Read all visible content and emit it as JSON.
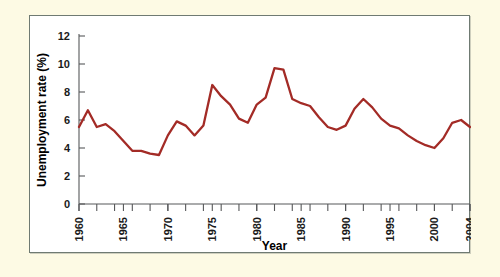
{
  "figure": {
    "background_color": "#fdfae4",
    "panel_background_color": "#ffffff",
    "panel_border_color": "#6f7a72",
    "line_color": "#a32b26",
    "axis_color": "#57585a"
  },
  "chart_data": {
    "type": "line",
    "title": "",
    "xlabel": "Year",
    "ylabel": "Unemployment rate (%)",
    "xlim": [
      1960,
      2004
    ],
    "ylim": [
      0,
      12
    ],
    "grid": false,
    "legend": "none",
    "y_ticks": [
      0,
      2,
      4,
      6,
      8,
      10,
      12
    ],
    "y_tick_labels": [
      "0",
      "2",
      "4",
      "6",
      "8",
      "10",
      "12"
    ],
    "x_ticks": [
      1960,
      1965,
      1970,
      1975,
      1980,
      1985,
      1990,
      1995,
      2000,
      2004
    ],
    "x_tick_labels": [
      "1960",
      "1965",
      "1970",
      "1975",
      "1980",
      "1985",
      "1990",
      "1995",
      "2000",
      "2004"
    ],
    "x_minor_tick_interval": 1,
    "x": [
      1960,
      1961,
      1962,
      1963,
      1964,
      1965,
      1966,
      1967,
      1968,
      1969,
      1970,
      1971,
      1972,
      1973,
      1974,
      1975,
      1976,
      1977,
      1978,
      1979,
      1980,
      1981,
      1982,
      1983,
      1984,
      1985,
      1986,
      1987,
      1988,
      1989,
      1990,
      1991,
      1992,
      1993,
      1994,
      1995,
      1996,
      1997,
      1998,
      1999,
      2000,
      2001,
      2002,
      2003,
      2004
    ],
    "values": [
      5.5,
      6.7,
      5.5,
      5.7,
      5.2,
      4.5,
      3.8,
      3.8,
      3.6,
      3.5,
      4.9,
      5.9,
      5.6,
      4.9,
      5.6,
      8.5,
      7.7,
      7.1,
      6.1,
      5.8,
      7.1,
      7.6,
      9.7,
      9.6,
      7.5,
      7.2,
      7.0,
      6.2,
      5.5,
      5.3,
      5.6,
      6.8,
      7.5,
      6.9,
      6.1,
      5.6,
      5.4,
      4.9,
      4.5,
      4.2,
      4.0,
      4.7,
      5.8,
      6.0,
      5.5
    ],
    "value_unit": "%",
    "series_name": "Unemployment rate"
  }
}
